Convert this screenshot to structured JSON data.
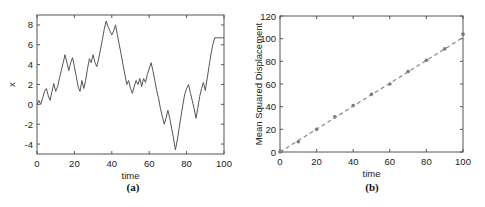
{
  "chart_data": [
    {
      "id": "a",
      "type": "line",
      "caption": "(a)",
      "title": "",
      "xlabel": "time",
      "ylabel": "x",
      "xlim": [
        0,
        100
      ],
      "ylim": [
        -5,
        9
      ],
      "xticks": [
        0,
        20,
        40,
        60,
        80,
        100
      ],
      "yticks": [
        -4,
        -2,
        0,
        2,
        4,
        6,
        8
      ],
      "grid": false,
      "legend": null,
      "series": [
        {
          "name": "random walk",
          "color": "#555555",
          "x": [
            0,
            1,
            2,
            3,
            4,
            5,
            6,
            7,
            8,
            9,
            10,
            11,
            12,
            13,
            14,
            15,
            16,
            17,
            18,
            19,
            20,
            21,
            22,
            23,
            24,
            25,
            26,
            27,
            28,
            29,
            30,
            31,
            32,
            33,
            34,
            35,
            36,
            37,
            38,
            39,
            40,
            41,
            42,
            43,
            44,
            45,
            46,
            47,
            48,
            49,
            50,
            51,
            52,
            53,
            54,
            55,
            56,
            57,
            58,
            59,
            60,
            61,
            62,
            63,
            64,
            65,
            66,
            67,
            68,
            69,
            70,
            71,
            72,
            73,
            74,
            75,
            76,
            77,
            78,
            79,
            80,
            81,
            82,
            83,
            84,
            85,
            86,
            87,
            88,
            89,
            90,
            91,
            92,
            93,
            94,
            95,
            96,
            97,
            98,
            99,
            100
          ],
          "y": [
            0,
            0.4,
            0,
            0.6,
            1.3,
            1.6,
            0.9,
            0.4,
            1.3,
            2.1,
            1.3,
            1.8,
            2.6,
            3.4,
            4.2,
            5.0,
            4.2,
            3.4,
            4.2,
            4.7,
            3.8,
            2.8,
            1.8,
            1.3,
            2.4,
            1.6,
            2.4,
            3.6,
            4.6,
            4.2,
            5.0,
            4.2,
            3.8,
            4.6,
            5.6,
            6.6,
            7.6,
            8.4,
            7.8,
            7.4,
            7.0,
            7.4,
            8.0,
            7.0,
            6.0,
            5.0,
            4.0,
            3.0,
            2.0,
            2.4,
            1.6,
            1.1,
            1.8,
            2.4,
            2.0,
            2.6,
            1.8,
            2.6,
            2.2,
            3.0,
            3.6,
            4.2,
            3.4,
            2.4,
            1.4,
            0.6,
            -0.4,
            -1.2,
            -2.0,
            -1.4,
            -0.6,
            -1.4,
            -2.4,
            -3.4,
            -4.6,
            -3.6,
            -2.4,
            -1.2,
            0.0,
            1.0,
            1.6,
            2.0,
            1.2,
            0.4,
            -0.4,
            -1.4,
            -0.4,
            0.8,
            1.6,
            2.2,
            1.4,
            2.6,
            3.8,
            5.0,
            6.0,
            6.7,
            6.7,
            6.7,
            6.7,
            6.7,
            6.7
          ]
        }
      ]
    },
    {
      "id": "b",
      "type": "scatter",
      "caption": "(b)",
      "title": "",
      "xlabel": "time",
      "ylabel": "Mean Squared Displacement",
      "xlim": [
        0,
        100
      ],
      "ylim": [
        0,
        120
      ],
      "xticks": [
        0,
        20,
        40,
        60,
        80,
        100
      ],
      "yticks": [
        0,
        20,
        40,
        60,
        80,
        100,
        120
      ],
      "grid": false,
      "legend": null,
      "series": [
        {
          "name": "simulated MSD",
          "marker": "o",
          "color": "#777777",
          "x": [
            0,
            10,
            20,
            30,
            40,
            50,
            60,
            70,
            80,
            90,
            100
          ],
          "y": [
            0,
            9,
            20,
            31,
            41,
            51,
            60,
            71,
            81,
            91,
            104
          ]
        },
        {
          "name": "linear fit",
          "style": "dashed",
          "color": "#888888",
          "x": [
            0,
            100
          ],
          "y": [
            0,
            101
          ]
        }
      ]
    }
  ]
}
